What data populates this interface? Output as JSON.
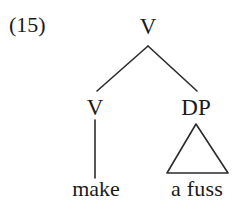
{
  "figure": {
    "example_number": "(15)",
    "background_color": "#ffffff",
    "line_color": "#2b2b2b",
    "text_color": "#1a1a1a",
    "width": 241,
    "height": 207
  },
  "tree": {
    "root": {
      "label": "V",
      "x": 148,
      "y": 26
    },
    "children": [
      {
        "label": "V",
        "x": 95,
        "y": 107,
        "leaf": {
          "text": "make",
          "x": 96,
          "y": 189,
          "connector": "line"
        }
      },
      {
        "label": "DP",
        "x": 196,
        "y": 107,
        "leaf": {
          "text": "a fuss",
          "x": 197,
          "y": 189,
          "connector": "triangle"
        }
      }
    ]
  },
  "geometry": {
    "root_branch_apex": {
      "x": 148,
      "y": 46
    },
    "left_branch_end": {
      "x": 97,
      "y": 91
    },
    "right_branch_end": {
      "x": 197,
      "y": 91
    },
    "left_stem": {
      "x": 95,
      "y1": 120,
      "y2": 178
    },
    "triangle": {
      "apex_x": 196,
      "apex_y": 124,
      "base_left_x": 167,
      "base_right_x": 228,
      "base_y": 173
    }
  }
}
